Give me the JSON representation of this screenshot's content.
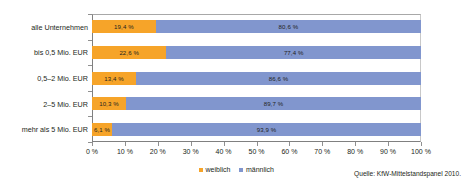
{
  "chart_data": {
    "type": "bar",
    "orientation": "horizontal",
    "stacked": true,
    "title": "",
    "xlabel": "",
    "ylabel": "",
    "xlim": [
      0,
      100
    ],
    "grid": false,
    "legend_position": "bottom-center",
    "categories": [
      "alle Unternehmen",
      "bis 0,5 Mio. EUR",
      "0,5–2 Mio. EUR",
      "2–5 Mio. EUR",
      "mehr als 5 Mio. EUR"
    ],
    "series": [
      {
        "name": "weiblich",
        "color": "#f6a429",
        "values": [
          19.4,
          22.6,
          13.4,
          10.3,
          6.1
        ],
        "labels": [
          "19,4 %",
          "22,6 %",
          "13,4 %",
          "10,3 %",
          "6,1 %"
        ]
      },
      {
        "name": "männlich",
        "color": "#8196ce",
        "values": [
          80.6,
          77.4,
          86.6,
          89.7,
          93.9
        ],
        "labels": [
          "80,6 %",
          "77,4 %",
          "86,6 %",
          "89,7 %",
          "93,9 %"
        ]
      }
    ],
    "xticks": [
      0,
      10,
      20,
      30,
      40,
      50,
      60,
      70,
      80,
      90,
      100
    ],
    "xticklabels": [
      "0 %",
      "10 %",
      "20 %",
      "30 %",
      "40 %",
      "50 %",
      "60 %",
      "70 %",
      "80 %",
      "90 %",
      "100 %"
    ]
  },
  "legend": {
    "items": [
      {
        "label": "weiblich"
      },
      {
        "label": "männlich"
      }
    ]
  },
  "source": {
    "text": "Quelle: KfW-Mittelstandspanel 2010."
  }
}
